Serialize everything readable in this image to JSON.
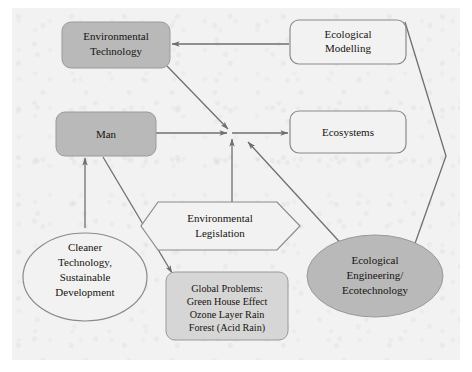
{
  "diagram": {
    "type": "flowchart",
    "title": "",
    "background_color": "#f2f2f2",
    "frame_color": "#ffffff",
    "nodes": [
      {
        "id": "environmental_technology",
        "label_lines": [
          "Environmental",
          "Technology"
        ],
        "shape": "rounded-rect",
        "fill": "#b9b9b9",
        "stroke": "#8f8f8f"
      },
      {
        "id": "ecological_modelling",
        "label_lines": [
          "Ecological",
          "Modelling"
        ],
        "shape": "rounded-rect",
        "fill": "#f2f2f2",
        "stroke": "#8a8a8a"
      },
      {
        "id": "man",
        "label_lines": [
          "Man"
        ],
        "shape": "rounded-rect",
        "fill": "#b9b9b9",
        "stroke": "#8f8f8f"
      },
      {
        "id": "ecosystems",
        "label_lines": [
          "Ecosystems"
        ],
        "shape": "rounded-rect",
        "fill": "#f2f2f2",
        "stroke": "#8a8a8a"
      },
      {
        "id": "environmental_legislation",
        "label_lines": [
          "Environmental",
          "Legislation"
        ],
        "shape": "hexagon",
        "fill": "#f2f2f2",
        "stroke": "#8a8a8a"
      },
      {
        "id": "cleaner_technology",
        "label_lines": [
          "Cleaner",
          "Technology,",
          "Sustainable",
          "Development"
        ],
        "shape": "ellipse",
        "fill": "#f2f2f2",
        "stroke": "#8a8a8a"
      },
      {
        "id": "global_problems",
        "label_lines": [
          "Global Problems:",
          "Green House Effect",
          "Ozone Layer Rain",
          "Forest (Acid Rain)"
        ],
        "shape": "rounded-rect",
        "fill": "#d6d6d6",
        "stroke": "#8f8f8f"
      },
      {
        "id": "ecological_engineering",
        "label_lines": [
          "Ecological",
          "Engineering/",
          "Ecotechnology"
        ],
        "shape": "ellipse",
        "fill": "#b9b9b9",
        "stroke": "#8f8f8f"
      }
    ],
    "edges": [
      {
        "id": "modelling-to-envtech",
        "from": "ecological_modelling",
        "to": "environmental_technology",
        "arrow": true
      },
      {
        "id": "envtech-to-junction",
        "from": "environmental_technology",
        "to": "ecosystems",
        "arrow": true
      },
      {
        "id": "man-to-junction",
        "from": "man",
        "to": "ecosystems",
        "arrow": true
      },
      {
        "id": "junction-to-ecosystems",
        "from": "junction",
        "to": "ecosystems",
        "arrow": true
      },
      {
        "id": "legislation-to-junction",
        "from": "environmental_legislation",
        "to": "ecosystems",
        "arrow": true
      },
      {
        "id": "ecoeng-to-junction",
        "from": "ecological_engineering",
        "to": "ecosystems",
        "arrow": true
      },
      {
        "id": "cleaner-to-man",
        "from": "cleaner_technology",
        "to": "man",
        "arrow": true
      },
      {
        "id": "man-to-globalproblems",
        "from": "man",
        "to": "global_problems",
        "arrow": true
      },
      {
        "id": "modelling-to-ecoeng",
        "from": "ecological_modelling",
        "to": "ecological_engineering",
        "arrow": true
      }
    ]
  }
}
